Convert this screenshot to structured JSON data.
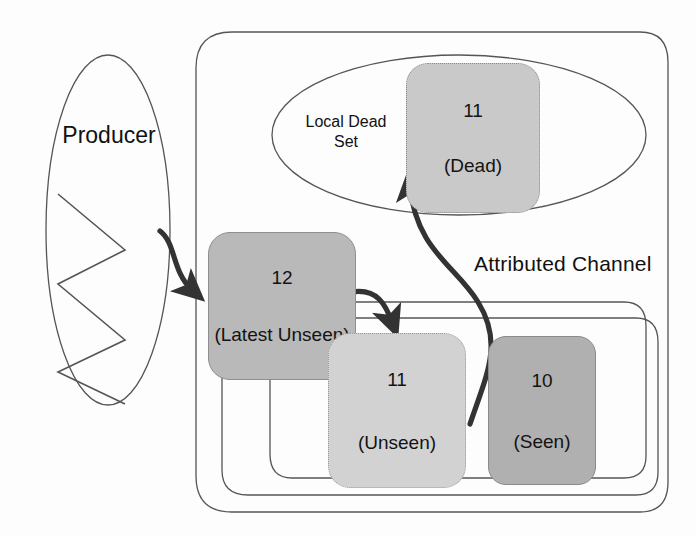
{
  "diagram": {
    "title": "Attributed Channel",
    "producer": {
      "label": "Producer",
      "icon": "zigzag-signal-icon"
    },
    "local_dead_set": {
      "label_line1": "Local Dead",
      "label_line2": "Set"
    },
    "channel_label": "Attributed Channel",
    "nodes": [
      {
        "id": "latest-unseen",
        "number": "12",
        "state": "(Latest Unseen)",
        "fill": "#b9b9b9",
        "border_style": "solid"
      },
      {
        "id": "dead",
        "number": "11",
        "state": "(Dead)",
        "fill": "#c9c9c9",
        "border_style": "dotted"
      },
      {
        "id": "unseen",
        "number": "11",
        "state": "(Unseen)",
        "fill": "#d2d2d2",
        "border_style": "dotted"
      },
      {
        "id": "seen",
        "number": "10",
        "state": "(Seen)",
        "fill": "#b0b0b0",
        "border_style": "solid"
      }
    ],
    "arrows": [
      {
        "id": "producer-to-latest-unseen",
        "from": "producer",
        "to": "latest-unseen"
      },
      {
        "id": "latest-unseen-to-unseen",
        "from": "latest-unseen",
        "to": "unseen"
      },
      {
        "id": "unseen-to-dead",
        "from": "unseen",
        "to": "dead"
      }
    ],
    "colors": {
      "stroke": "#555555",
      "arrow": "#333333",
      "text": "#111111",
      "background": "#fdfdfd"
    }
  }
}
